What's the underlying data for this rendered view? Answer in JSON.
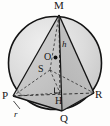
{
  "figure": {
    "labels": {
      "apex": "M",
      "base_left": "P",
      "base_front": "Q",
      "base_right": "R",
      "sphere_centre": "O",
      "inner_point": "S",
      "foot_of_altitude": "H",
      "height": "h",
      "radius": "r"
    },
    "colors": {
      "stroke": "#1a1a1a",
      "circle_fill": "#d9d9d9",
      "base_fill": "#c9c9c9",
      "face_fill": "#bdbdbd",
      "dashed": "#2b2b2b",
      "background": "#fdfdfc"
    },
    "geometry": {
      "circle": {
        "cx": 55,
        "cy": 63,
        "r": 47
      },
      "points": {
        "M": {
          "x": 59,
          "y": 15
        },
        "P": {
          "x": 13,
          "y": 96
        },
        "Q": {
          "x": 62,
          "y": 111
        },
        "R": {
          "x": 94,
          "y": 93
        },
        "O": {
          "x": 55,
          "y": 58
        },
        "S": {
          "x": 50,
          "y": 70
        },
        "H": {
          "x": 60,
          "y": 93
        }
      }
    }
  }
}
